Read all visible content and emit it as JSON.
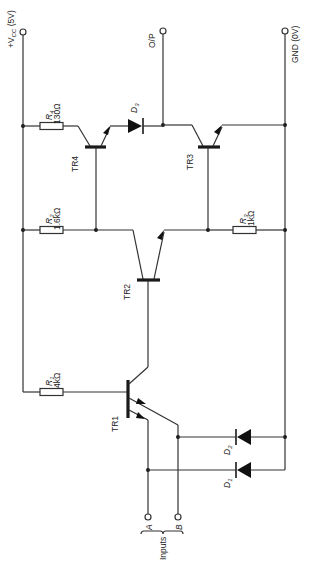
{
  "diagram": {
    "terminals": {
      "vcc": {
        "label": "+V",
        "sub": "CC",
        "suffix": " (5V)"
      },
      "output": {
        "label": "O/P"
      },
      "gnd": {
        "label": "GND (0V)"
      },
      "input_a": {
        "label": "A"
      },
      "input_b": {
        "label": "B"
      },
      "inputs_group": {
        "label": "Inputs"
      }
    },
    "resistors": [
      {
        "id": "R1",
        "name": "R",
        "sub": "1",
        "value": "4kΩ"
      },
      {
        "id": "R2",
        "name": "R",
        "sub": "2",
        "value": "1.6kΩ"
      },
      {
        "id": "R3",
        "name": "R",
        "sub": "3",
        "value": "1kΩ"
      },
      {
        "id": "R4",
        "name": "R",
        "sub": "4",
        "value": "130Ω"
      }
    ],
    "transistors": [
      {
        "id": "TR1",
        "label": "TR1",
        "type": "NPN multi-emitter"
      },
      {
        "id": "TR2",
        "label": "TR2",
        "type": "NPN"
      },
      {
        "id": "TR3",
        "label": "TR3",
        "type": "NPN"
      },
      {
        "id": "TR4",
        "label": "TR4",
        "type": "NPN"
      }
    ],
    "diodes": [
      {
        "id": "D1",
        "name": "D",
        "sub": "1"
      },
      {
        "id": "D2",
        "name": "D",
        "sub": "2"
      },
      {
        "id": "D3",
        "name": "D",
        "sub": "3"
      }
    ],
    "colors": {
      "ink": "#222222",
      "background": "#ffffff"
    }
  }
}
